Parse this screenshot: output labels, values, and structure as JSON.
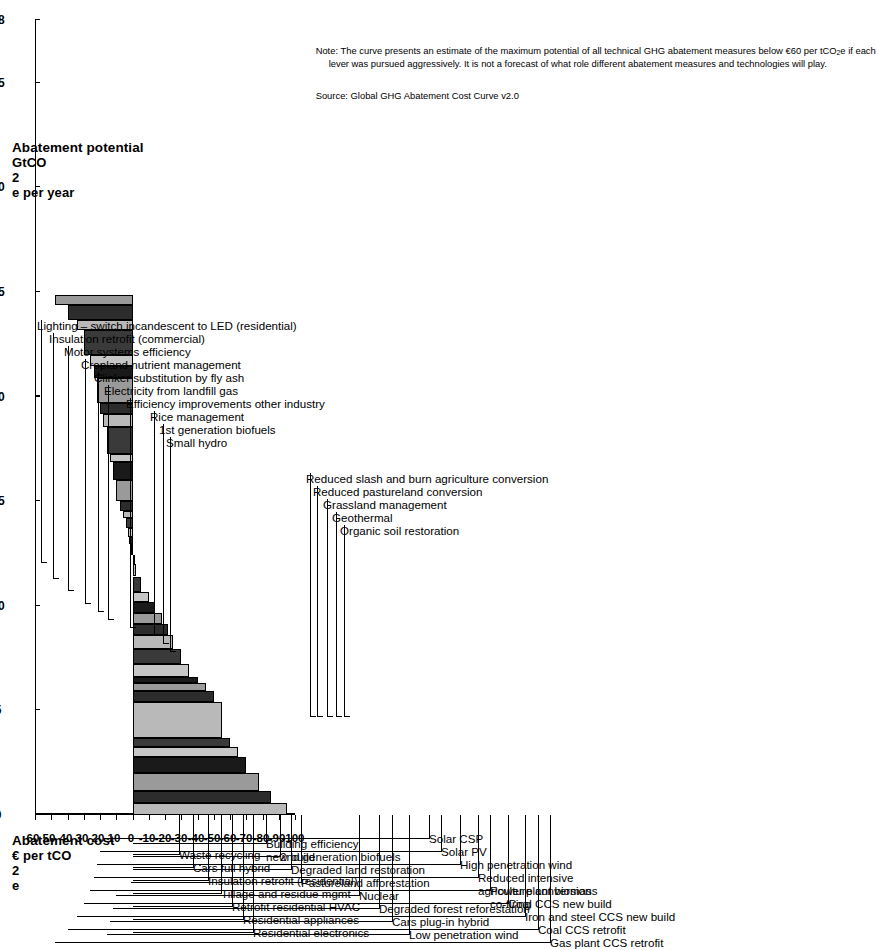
{
  "figure": {
    "title_cost": "Abatement cost",
    "unit_cost": "€ per tCO₂e",
    "title_potential": "Abatement potential",
    "unit_potential": "GtCO₂e per year",
    "note": "Note: The curve presents an estimate of the maximum potential of all technical GHG abatement measures below €60 per tCO₂e if each\n           lever was pursued aggressively. It is not a forecast of what role different abatement measures and technologies will play.",
    "source": "Source: Global GHG Abatement Cost Curve v2.0"
  },
  "axes": {
    "cost_label": "Abatement cost",
    "cost_unit": "€ per tCO2e",
    "cost_ticks": [
      60,
      50,
      40,
      30,
      20,
      10,
      0,
      -10,
      -20,
      -30,
      -40,
      -50,
      -60,
      -70,
      -80,
      -90,
      -100
    ],
    "cost_tick_labels": [
      "60",
      "50",
      "40",
      "30",
      "20",
      "10",
      "0",
      "-10",
      "-20",
      "-30",
      "-40",
      "-50",
      "-60",
      "-70",
      "-80",
      "-90",
      "-100"
    ],
    "cost_min": -100,
    "cost_max": 60,
    "potential_label": "Abatement potential",
    "potential_unit": "GtCO2e per year",
    "potential_ticks": [
      0,
      5,
      10,
      15,
      20,
      25,
      30,
      35,
      38
    ],
    "potential_tick_labels": [
      "0",
      "5",
      "10",
      "15",
      "20",
      "25",
      "30",
      "35",
      "38"
    ],
    "potential_min": 0,
    "potential_max": 38
  },
  "chart_data": {
    "type": "bar",
    "title": "Global GHG Abatement Cost Curve v2.0",
    "xlabel": "Abatement potential — GtCO2e per year",
    "ylabel": "Abatement cost — € per tCO2e",
    "xlim": [
      0,
      38
    ],
    "ylim": [
      -100,
      60
    ],
    "grid": false,
    "legend": "none",
    "note": "Cumulative (marimekko) cost curve: bar width = abatement potential (GtCO2e/yr), bar height = abatement cost (€/tCO2e). Bars are sorted by increasing cost from left to right.",
    "categories": [
      "Lighting – switch incandescent to LED (residential)",
      "Insulation retrofit (commercial)",
      "Motor systems efficiency",
      "Cropland nutrient management",
      "Clinker substitution by fly ash",
      "Electricity from landfill gas",
      "Efficiency improvements other industry",
      "Rice management",
      "1st generation biofuels",
      "Small hydro",
      "Waste recycling",
      "Cars full hybrid",
      "Insulation retrofit (residential)",
      "Tillage and residue mgmt",
      "Retrofit residential HVAC",
      "Residential appliances",
      "Residential electronics",
      "Building efficiency new build",
      "2nd generation biofuels",
      "Degraded land restoration",
      "Pastureland afforestation",
      "Reduced slash and burn agriculture conversion",
      "Reduced pastureland conversion",
      "Grassland management",
      "Geothermal",
      "Organic soil restoration",
      "Nuclear",
      "Degraded forest reforestation",
      "Cars plug-in hybrid",
      "Low penetration wind",
      "Solar CSP",
      "Solar PV",
      "High penetration wind",
      "Reduced intensive agriculture conversion",
      "Power plant biomass co-firing",
      "Coal CCS new build",
      "Iron and steel CCS new build",
      "Coal CCS retrofit",
      "Gas plant CCS retrofit"
    ],
    "widths_gt": [
      0.55,
      0.6,
      0.85,
      0.75,
      0.5,
      0.45,
      1.7,
      0.55,
      0.35,
      0.3,
      0.6,
      0.75,
      0.65,
      0.55,
      0.5,
      0.55,
      0.45,
      0.75,
      0.6,
      0.45,
      0.5,
      0.35,
      0.4,
      0.5,
      0.35,
      0.45,
      1.0,
      0.85,
      0.4,
      1.3,
      0.6,
      0.55,
      1.2,
      0.55,
      0.55,
      1.2,
      0.45,
      0.75,
      0.45
    ],
    "costs_eur": [
      -95,
      -85,
      -78,
      -70,
      -65,
      -60,
      -55,
      -50,
      -45,
      -40,
      -35,
      -30,
      -25,
      -22,
      -18,
      -14,
      -10,
      -5,
      -2,
      0,
      1,
      2,
      3,
      4,
      6,
      8,
      10,
      12,
      14,
      16,
      18,
      20,
      22,
      24,
      26,
      30,
      34,
      40,
      48
    ]
  },
  "left_labels": [
    {
      "text": "Residential electronics",
      "cost": 50
    },
    {
      "text": "Residential appliances",
      "cost": 45
    },
    {
      "text": "Retrofit residential HVAC",
      "cost": 38
    },
    {
      "text": "Tillage and residue mgmt",
      "cost": 31
    },
    {
      "text": "Insulation retrofit (residential)",
      "cost": 24
    },
    {
      "text": "Cars full hybrid",
      "cost": 15
    },
    {
      "text": "Waste recycling",
      "cost": 8
    },
    {
      "text": "Low penetration wind",
      "cost": 0
    },
    {
      "text": "Cars plug-in hybrid",
      "cost": 0
    },
    {
      "text": "Degraded forest reforestation",
      "cost": 0
    },
    {
      "text": "Nuclear",
      "cost": 0
    },
    {
      "text": "Pastureland afforestation",
      "cost": 0
    },
    {
      "text": "Degraded land restoration",
      "cost": 0
    },
    {
      "text": "2nd generation biofuels",
      "cost": 0
    },
    {
      "text": "Building efficiency\nnew build",
      "cost": 0
    },
    {
      "text": "Gas plant CCS retrofit",
      "cost": 0
    },
    {
      "text": "Coal CCS retrofit",
      "cost": 0
    },
    {
      "text": "Iron and steel CCS new build",
      "cost": 0
    },
    {
      "text": "Coal CCS new build",
      "cost": 0
    },
    {
      "text": "Power plant biomass\nco-firing",
      "cost": 0
    },
    {
      "text": "Reduced intensive\nagriculture conversion",
      "cost": 0
    },
    {
      "text": "High penetration wind",
      "cost": 0
    },
    {
      "text": "Solar PV",
      "cost": 0
    },
    {
      "text": "Solar CSP",
      "cost": 0
    }
  ],
  "right_labels": [
    {
      "text": "Organic soil restoration"
    },
    {
      "text": "Geothermal"
    },
    {
      "text": "Grassland management"
    },
    {
      "text": "Reduced pastureland conversion"
    },
    {
      "text": "Reduced slash and burn agriculture conversion"
    },
    {
      "text": "Small hydro"
    },
    {
      "text": "1st generation biofuels"
    },
    {
      "text": "Rice management"
    },
    {
      "text": "Efficiency improvements other industry"
    },
    {
      "text": "Electricity from landfill gas"
    },
    {
      "text": "Clinker substitution by fly ash"
    },
    {
      "text": "Cropland nutrient management"
    },
    {
      "text": "Motor systems efficiency"
    },
    {
      "text": "Insulation retrofit (commercial)"
    },
    {
      "text": "Lighting – switch incandescent to LED (residential)"
    }
  ]
}
